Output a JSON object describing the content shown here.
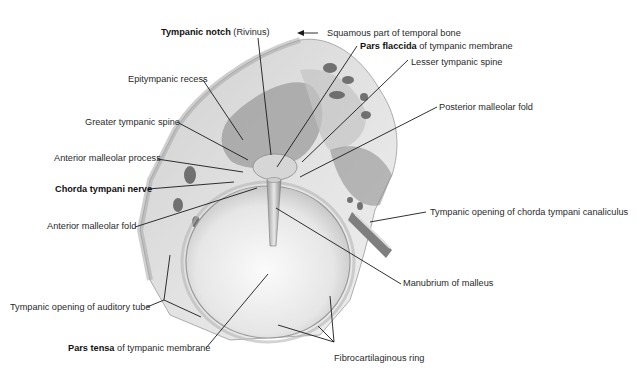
{
  "figure": {
    "colors": {
      "background": "#ffffff",
      "bone": "#d9d9d9",
      "bone_dark": "#8a8a8a",
      "membrane": "#ececec",
      "leader_line": "#1a1a1a",
      "label_text": "#2a2a2a"
    }
  },
  "labels": {
    "tympanic_notch": {
      "bold": "Tympanic notch",
      "rest": " (Rivinus)"
    },
    "squamous_part": {
      "bold": "",
      "rest": "Squamous part of temporal bone"
    },
    "pars_flaccida": {
      "bold": "Pars flaccida",
      "rest": " of tympanic membrane"
    },
    "lesser_tympanic_spine": {
      "bold": "",
      "rest": "Lesser tympanic spine"
    },
    "epitympanic_recess": {
      "bold": "",
      "rest": "Epitympanic recess"
    },
    "posterior_malleolar_fold": {
      "bold": "",
      "rest": "Posterior malleolar fold"
    },
    "greater_tympanic_spine": {
      "bold": "",
      "rest": "Greater tympanic spine"
    },
    "anterior_malleolar_process": {
      "bold": "",
      "rest": "Anterior malleolar process"
    },
    "chorda_tympani_nerve": {
      "bold": "Chorda tympani nerve",
      "rest": ""
    },
    "anterior_malleolar_fold": {
      "bold": "",
      "rest": "Anterior malleolar fold"
    },
    "tympanic_opening_chorda": {
      "bold": "",
      "rest": "Tympanic opening of chorda tympani canaliculus"
    },
    "manubrium_of_malleus": {
      "bold": "",
      "rest": "Manubrium of malleus"
    },
    "tympanic_opening_auditory_tube": {
      "bold": "",
      "rest": "Tympanic opening of auditory tube"
    },
    "pars_tensa": {
      "bold": "Pars tensa",
      "rest": " of tympanic membrane"
    },
    "fibrocartilaginous_ring": {
      "bold": "",
      "rest": "Fibrocartilaginous ring"
    }
  }
}
